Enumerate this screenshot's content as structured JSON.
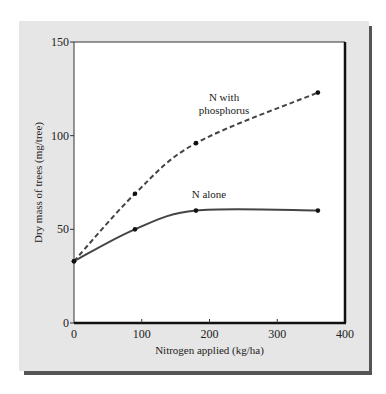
{
  "chart_data": {
    "type": "line",
    "title": "",
    "xlabel": "Nitrogen applied (kg/ha)",
    "ylabel": "Dry mass of trees (mg/tree)",
    "xlim": [
      0,
      400
    ],
    "ylim": [
      0,
      150
    ],
    "x_ticks": [
      0,
      100,
      200,
      300,
      400
    ],
    "y_ticks": [
      0,
      50,
      100,
      150
    ],
    "grid": false,
    "legend": "inline labels",
    "series": [
      {
        "name": "N with phosphorus",
        "label_lines": [
          "N with",
          "phosphorus"
        ],
        "style": "dashed",
        "x": [
          0,
          90,
          180,
          360
        ],
        "values": [
          33,
          69,
          96,
          123
        ]
      },
      {
        "name": "N alone",
        "label_lines": [
          "N alone"
        ],
        "style": "solid",
        "x": [
          0,
          90,
          180,
          360
        ],
        "values": [
          33,
          50,
          60,
          60
        ]
      }
    ]
  },
  "colors": {
    "panel_bg": "#e6e6e6",
    "panel_shadow": "#555555",
    "plot_bg": "#ffffff",
    "line": "#444444"
  }
}
